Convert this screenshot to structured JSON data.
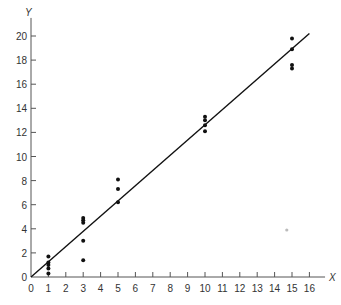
{
  "chart_data": {
    "type": "scatter",
    "title": "",
    "xlabel": "X",
    "ylabel": "Y",
    "xlim": [
      0,
      16
    ],
    "ylim": [
      0,
      20
    ],
    "grid": false,
    "legend": null,
    "x_ticks": [
      0,
      1,
      2,
      3,
      4,
      5,
      6,
      7,
      8,
      9,
      10,
      11,
      12,
      13,
      14,
      15,
      16
    ],
    "x_tick_labels": [
      "0",
      "1",
      "2",
      "3",
      "4",
      "5",
      "6",
      "7",
      "8",
      "9",
      "10",
      "11",
      "12",
      "13",
      "14",
      "15",
      "16"
    ],
    "y_ticks": [
      0,
      2,
      4,
      6,
      8,
      10,
      12,
      14,
      16,
      18,
      20
    ],
    "y_tick_labels": [
      "0",
      "2",
      "4",
      "6",
      "8",
      "10",
      "12",
      "14",
      "16",
      "18",
      "20"
    ],
    "series": [
      {
        "name": "observations",
        "type": "scatter",
        "points": [
          {
            "x": 1,
            "y": 1.7
          },
          {
            "x": 1,
            "y": 1.2
          },
          {
            "x": 1,
            "y": 1.0
          },
          {
            "x": 1,
            "y": 0.7
          },
          {
            "x": 1,
            "y": 0.3
          },
          {
            "x": 3,
            "y": 4.9
          },
          {
            "x": 3,
            "y": 4.7
          },
          {
            "x": 3,
            "y": 4.5
          },
          {
            "x": 3,
            "y": 3.0
          },
          {
            "x": 3,
            "y": 1.4
          },
          {
            "x": 5,
            "y": 8.1
          },
          {
            "x": 5,
            "y": 7.3
          },
          {
            "x": 5,
            "y": 6.2
          },
          {
            "x": 10,
            "y": 13.3
          },
          {
            "x": 10,
            "y": 13.0
          },
          {
            "x": 10,
            "y": 12.6
          },
          {
            "x": 10,
            "y": 12.1
          },
          {
            "x": 15,
            "y": 19.8
          },
          {
            "x": 15,
            "y": 18.9
          },
          {
            "x": 15,
            "y": 17.6
          },
          {
            "x": 15,
            "y": 17.3
          }
        ]
      },
      {
        "name": "fitted line",
        "type": "line",
        "points": [
          {
            "x": 0,
            "y": 0
          },
          {
            "x": 16,
            "y": 20.2
          }
        ]
      }
    ],
    "annotations": [
      {
        "type": "faint-dot",
        "x": 14.7,
        "y": 3.9,
        "color": "#bbbbbb"
      }
    ]
  },
  "colors": {
    "axis": "#555555",
    "points": "#111111",
    "line": "#111111",
    "faint": "#bbbbbb"
  }
}
